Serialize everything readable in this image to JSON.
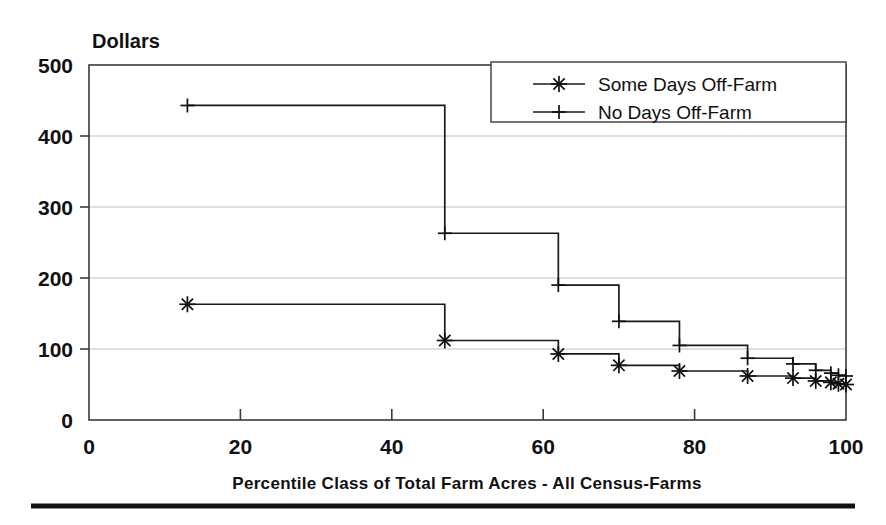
{
  "chart_data": {
    "type": "line",
    "title": "",
    "subtitle": "",
    "ylabel": "Dollars",
    "xlabel": "Percentile Class of Total Farm Acres - All Census-Farms",
    "xlim": [
      0,
      100
    ],
    "ylim": [
      0,
      500
    ],
    "xticks": [
      0,
      20,
      40,
      60,
      80,
      100
    ],
    "yticks": [
      0,
      100,
      200,
      300,
      400,
      500
    ],
    "xtick_labels": [
      "0",
      "20",
      "40",
      "60",
      "80",
      "100"
    ],
    "ytick_labels": [
      "0",
      "100",
      "200",
      "300",
      "400",
      "500"
    ],
    "grid": "horizontal",
    "legend_position": "top-right",
    "step_style": "step-post",
    "series": [
      {
        "name": "Some Days Off-Farm",
        "marker": "asterisk",
        "x": [
          13,
          47,
          62,
          70,
          78,
          87,
          93,
          96,
          98,
          99,
          100
        ],
        "values": [
          163,
          112,
          93,
          77,
          69,
          62,
          59,
          55,
          53,
          51,
          50
        ]
      },
      {
        "name": "No Days Off-Farm",
        "marker": "plus",
        "x": [
          13,
          47,
          62,
          70,
          78,
          87,
          93,
          96,
          98,
          99,
          100
        ],
        "values": [
          443,
          263,
          190,
          139,
          105,
          87,
          79,
          70,
          66,
          63,
          62
        ]
      }
    ],
    "annotations": []
  },
  "legend": {
    "entries": [
      {
        "label": "Some Days Off-Farm",
        "marker": "asterisk"
      },
      {
        "label": "No Days Off-Farm",
        "marker": "plus"
      }
    ]
  },
  "colors": {
    "ink": "#111111",
    "frame": "#3a3a3a",
    "grid": "#b9b9b9",
    "background": "#ffffff",
    "rule": "#121212"
  }
}
